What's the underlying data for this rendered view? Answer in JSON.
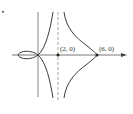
{
  "figure": {
    "points": [
      {
        "label": "(2, 0)",
        "x": 2,
        "y": 0
      },
      {
        "label": "(6, 0)",
        "x": 6,
        "y": 0
      }
    ],
    "asymptote": {
      "type": "vertical",
      "x": 2,
      "style": "dashed"
    },
    "colors": {
      "curve": "#3a3a3a",
      "axis": "#555555",
      "asymptote": "#8a8a8a",
      "background": "#ffffff"
    }
  }
}
